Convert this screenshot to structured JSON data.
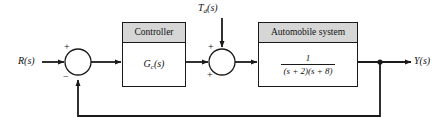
{
  "diagram": {
    "background_color": "#ffffff",
    "line_color": "#1a1a1a",
    "header_fill": "#d6d6d6",
    "signals": {
      "reference": "R(s)",
      "output": "Y(s)",
      "disturbance_base": "T",
      "disturbance_sub": "d",
      "disturbance_tail": "(s)"
    },
    "blocks": [
      {
        "id": "controller",
        "header": "Controller",
        "body_base": "G",
        "body_sub": "c",
        "body_tail": "(s)"
      },
      {
        "id": "automobile",
        "header": "Automobile system",
        "numerator": "1",
        "denominator": "(s + 2)(s + 8)"
      }
    ],
    "summing_junctions": [
      {
        "id": "error-junction",
        "sign_top": "+",
        "sign_bottom": "−"
      },
      {
        "id": "disturbance-junction",
        "sign_top": "+",
        "sign_left": "+"
      }
    ]
  }
}
